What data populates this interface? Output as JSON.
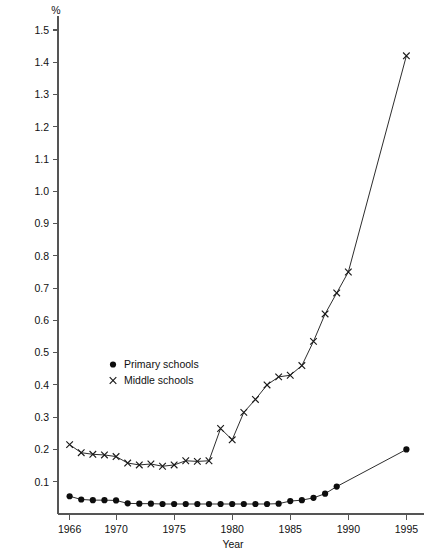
{
  "chart_data": {
    "type": "line",
    "title": "",
    "subtitle": "",
    "unit_label": "%",
    "xlabel": "Year",
    "ylabel": "",
    "xlim": [
      1965,
      1996
    ],
    "ylim": [
      0,
      1.5
    ],
    "grid": false,
    "legend_position": "inside-left",
    "x_ticks": [
      1966,
      1970,
      1975,
      1980,
      1985,
      1990,
      1995
    ],
    "x_tick_labels": [
      "1966",
      "1970",
      "1975",
      "1980",
      "1985",
      "1990",
      "1995"
    ],
    "y_ticks": [
      0.1,
      0.2,
      0.3,
      0.4,
      0.5,
      0.6,
      0.7,
      0.8,
      0.9,
      1.0,
      1.1,
      1.2,
      1.3,
      1.4,
      1.5
    ],
    "y_tick_labels": [
      "0.1",
      "0.2",
      "0.3",
      "0.4",
      "0.5",
      "0.6",
      "0.7",
      "0.8",
      "0.9",
      "1.0",
      "1.1",
      "1.2",
      "1.3",
      "1.4",
      "1.5"
    ],
    "series": [
      {
        "name": "Primary schools",
        "marker": "circle",
        "x": [
          1966,
          1967,
          1968,
          1969,
          1970,
          1971,
          1972,
          1973,
          1974,
          1975,
          1976,
          1977,
          1978,
          1979,
          1980,
          1981,
          1982,
          1983,
          1984,
          1985,
          1986,
          1987,
          1988,
          1989,
          1995
        ],
        "values": [
          0.055,
          0.045,
          0.043,
          0.043,
          0.042,
          0.033,
          0.032,
          0.032,
          0.031,
          0.031,
          0.031,
          0.031,
          0.031,
          0.031,
          0.031,
          0.031,
          0.031,
          0.031,
          0.032,
          0.04,
          0.043,
          0.05,
          0.063,
          0.085,
          0.2
        ]
      },
      {
        "name": "Middle schools",
        "marker": "cross",
        "x": [
          1966,
          1967,
          1968,
          1969,
          1970,
          1971,
          1972,
          1973,
          1974,
          1975,
          1976,
          1977,
          1978,
          1979,
          1980,
          1981,
          1982,
          1983,
          1984,
          1985,
          1986,
          1987,
          1988,
          1989,
          1990,
          1995
        ],
        "values": [
          0.215,
          0.19,
          0.185,
          0.183,
          0.178,
          0.158,
          0.152,
          0.155,
          0.148,
          0.152,
          0.165,
          0.163,
          0.165,
          0.265,
          0.23,
          0.315,
          0.355,
          0.4,
          0.425,
          0.43,
          0.46,
          0.535,
          0.62,
          0.685,
          0.75,
          1.42
        ]
      }
    ],
    "legend": [
      {
        "label": "Primary schools",
        "marker": "circle"
      },
      {
        "label": "Middle schools",
        "marker": "cross"
      }
    ]
  },
  "colors": {
    "line": "#222222",
    "marker": "#0d0d0d",
    "axis": "#555555",
    "text": "#111111",
    "background": "#ffffff"
  }
}
